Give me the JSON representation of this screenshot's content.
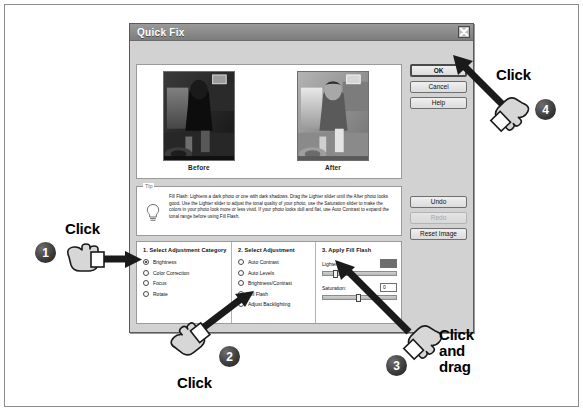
{
  "dialog": {
    "title": "Quick Fix",
    "close_icon": "close-x-icon",
    "preview": {
      "before_label": "Before",
      "after_label": "After"
    },
    "buttons": {
      "ok": "OK",
      "cancel": "Cancel",
      "help": "Help",
      "undo": "Undo",
      "redo": "Redo",
      "reset": "Reset Image"
    },
    "tip": {
      "legend": "Tip",
      "icon": "lightbulb-icon",
      "text": "Fill Flash: Lightens a dark photo or one with dark shadows. Drag the Lighter slider until the After photo looks good. Use the Lighter slider to adjust the tonal quality of your photo, use the Saturation slider to make the colors in your photo look more or less vivid. If your photo looks dull and flat, use Auto Contrast to expand the tonal range  before using Fill Flash."
    },
    "section1": {
      "title": "1. Select Adjustment Category",
      "options": [
        {
          "label": "Brightness",
          "checked": true
        },
        {
          "label": "Color Correction",
          "checked": false
        },
        {
          "label": "Focus",
          "checked": false
        },
        {
          "label": "Rotate",
          "checked": false
        }
      ]
    },
    "section2": {
      "title": "2. Select Adjustment",
      "options": [
        {
          "label": "Auto Contrast",
          "checked": false
        },
        {
          "label": "Auto Levels",
          "checked": false
        },
        {
          "label": "Brightness/Contrast",
          "checked": false
        },
        {
          "label": "Fill Flash",
          "checked": true
        },
        {
          "label": "Adjust Backlighting",
          "checked": false
        }
      ]
    },
    "section3": {
      "title": "3. Apply Fill Flash",
      "sliders": [
        {
          "label": "Lighter:",
          "value": "",
          "selected": true,
          "thumb_pct": 14
        },
        {
          "label": "Saturation:",
          "value": "0",
          "selected": false,
          "thumb_pct": 45
        }
      ]
    }
  },
  "annotations": [
    {
      "number": "1",
      "label": "Click",
      "icon": "pointing-hand-icon"
    },
    {
      "number": "2",
      "label": "Click",
      "icon": "pointing-hand-icon"
    },
    {
      "number": "3",
      "label": "Click and drag",
      "label_lines": [
        "Click",
        "and",
        "drag"
      ],
      "icon": "pointing-hand-icon"
    },
    {
      "number": "4",
      "label": "Click",
      "icon": "pointing-hand-icon"
    }
  ]
}
